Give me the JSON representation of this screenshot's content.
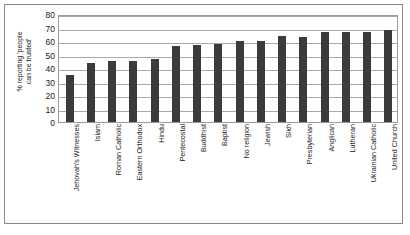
{
  "chart_data": {
    "type": "bar",
    "title": "",
    "xlabel": "",
    "ylabel": "% reporting 'people can be trusted'",
    "ylabel_line1": "% reporting 'people",
    "ylabel_line2": "can be trusted'",
    "ylim": [
      0,
      80
    ],
    "ytick_step": 10,
    "yticks": [
      80,
      70,
      60,
      50,
      40,
      30,
      20,
      10,
      0
    ],
    "grid": true,
    "legend": "none",
    "bar_color": "#3b3b3b",
    "categories": [
      "Jehovah's Witnesses",
      "Islam",
      "Roman Catholic",
      "Eastern Orthodox",
      "Hindu",
      "Pentecostal",
      "Buddhist",
      "Baptist",
      "No religion",
      "Jewish",
      "Sikh",
      "Presbyterian",
      "Anglican",
      "Lutheran",
      "Ukrainian Catholic",
      "United Church"
    ],
    "values": [
      35,
      44,
      45,
      45,
      47,
      56,
      57,
      58,
      60,
      60,
      64,
      63,
      67,
      67,
      67,
      68
    ]
  }
}
